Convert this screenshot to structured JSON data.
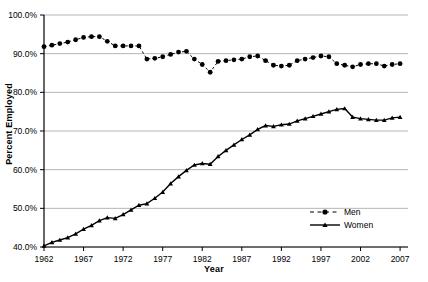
{
  "chart_data": {
    "type": "line",
    "title": "",
    "xlabel": "Year",
    "ylabel": "Percent Employed",
    "xlim": [
      1962,
      2008
    ],
    "ylim": [
      40,
      100
    ],
    "grid": true,
    "grid_axis": "y",
    "legend_position": "bottom-right",
    "y_tick_labels": [
      "100.0%",
      "90.0%",
      "80.0%",
      "70.0%",
      "60.0%",
      "50.0%",
      "40.0%"
    ],
    "y_ticks": [
      100,
      90,
      80,
      70,
      60,
      50,
      40
    ],
    "x_tick_labels": [
      "1962",
      "1967",
      "1972",
      "1977",
      "1982",
      "1987",
      "1992",
      "1997",
      "2002",
      "2007"
    ],
    "x_ticks": [
      1962,
      1967,
      1972,
      1977,
      1982,
      1987,
      1992,
      1997,
      2002,
      2007
    ],
    "x": [
      1962,
      1963,
      1964,
      1965,
      1966,
      1967,
      1968,
      1969,
      1970,
      1971,
      1972,
      1973,
      1974,
      1975,
      1976,
      1977,
      1978,
      1979,
      1980,
      1981,
      1982,
      1983,
      1984,
      1985,
      1986,
      1987,
      1988,
      1989,
      1990,
      1991,
      1992,
      1993,
      1994,
      1995,
      1996,
      1997,
      1998,
      1999,
      2000,
      2001,
      2002,
      2003,
      2004,
      2005,
      2006,
      2007
    ],
    "series": [
      {
        "name": "Men",
        "marker": "circle",
        "linestyle": "dashed",
        "color": "#000000",
        "values": [
          91.8,
          92.2,
          92.6,
          93.0,
          93.6,
          94.2,
          94.4,
          94.4,
          93.2,
          92.0,
          92.0,
          92.0,
          92.0,
          88.6,
          88.8,
          89.2,
          89.8,
          90.4,
          90.6,
          88.6,
          87.2,
          85.2,
          88.0,
          88.2,
          88.4,
          88.6,
          89.2,
          89.4,
          88.2,
          87.0,
          86.8,
          87.0,
          88.2,
          88.6,
          89.0,
          89.4,
          89.2,
          87.4,
          87.0,
          86.6,
          87.2,
          87.4,
          87.4,
          86.8,
          87.2,
          87.4
        ]
      },
      {
        "name": "Women",
        "marker": "triangle",
        "linestyle": "solid",
        "color": "#000000",
        "values": [
          40.3,
          41.2,
          41.8,
          42.4,
          43.4,
          44.6,
          45.6,
          46.8,
          47.6,
          47.4,
          48.4,
          49.6,
          50.8,
          51.2,
          52.6,
          54.2,
          56.4,
          58.2,
          59.8,
          61.2,
          61.6,
          61.4,
          63.4,
          65.0,
          66.4,
          67.8,
          69.0,
          70.4,
          71.4,
          71.2,
          71.6,
          71.8,
          72.6,
          73.2,
          73.8,
          74.4,
          75.0,
          75.6,
          75.8,
          73.6,
          73.2,
          73.0,
          72.8,
          72.8,
          73.4,
          73.6
        ]
      }
    ]
  },
  "legend": {
    "items": [
      {
        "label": "Men"
      },
      {
        "label": "Women"
      }
    ]
  }
}
